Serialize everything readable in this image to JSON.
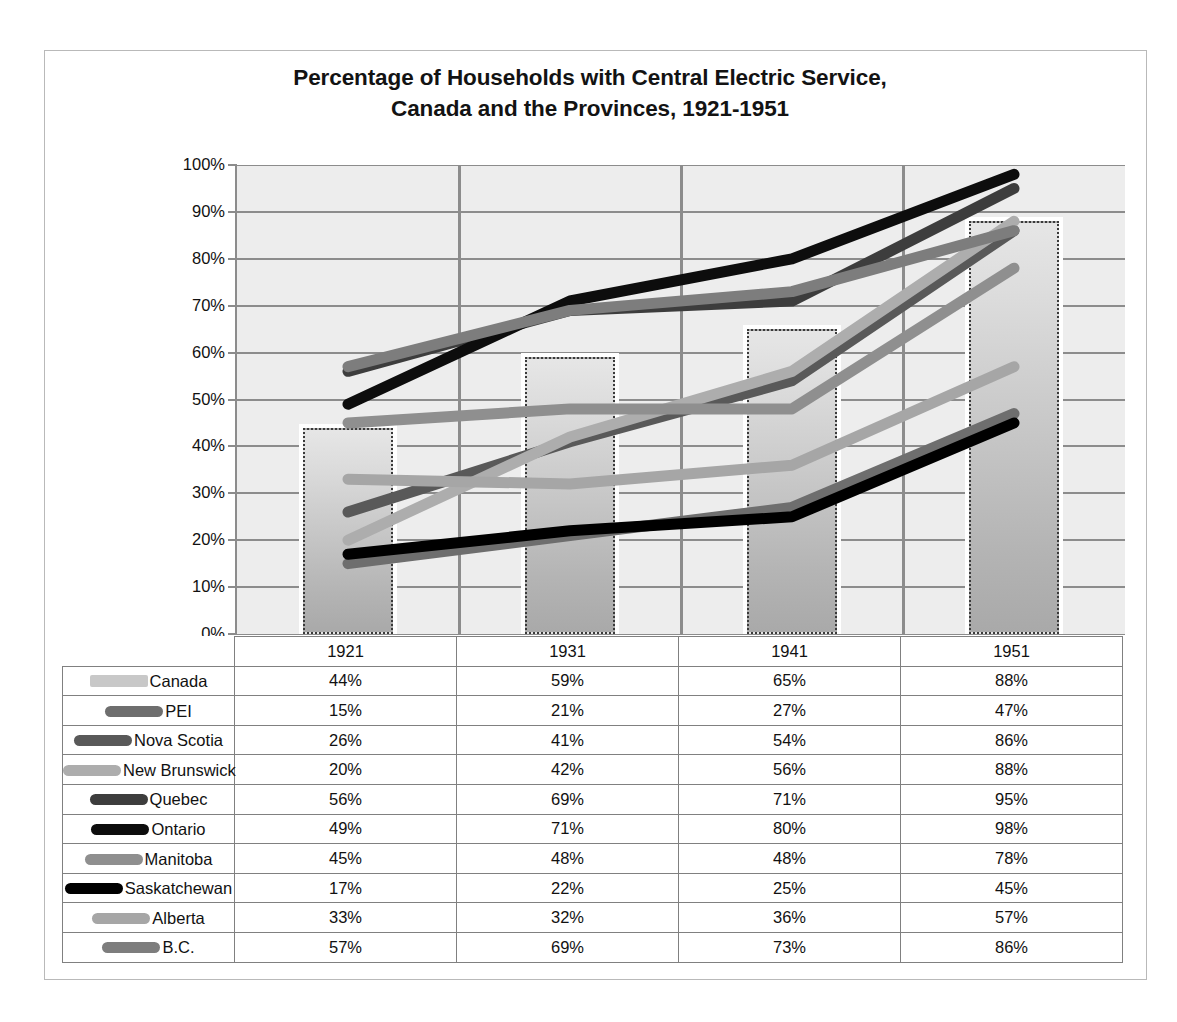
{
  "chart_data": {
    "type": "line",
    "title_line1": "Percentage of Households  with Central Electric Service,",
    "title_line2": "Canada  and the Provinces, 1921-1951",
    "title": "Percentage of Households with Central Electric Service, Canada and the Provinces, 1921-1951",
    "xlabel": "",
    "ylabel": "",
    "categories": [
      "1921",
      "1931",
      "1941",
      "1951"
    ],
    "ylim": [
      0,
      100
    ],
    "ytick_labels": [
      "0%",
      "10%",
      "20%",
      "30%",
      "40%",
      "50%",
      "60%",
      "70%",
      "80%",
      "90%",
      "100%"
    ],
    "ytick_values": [
      0,
      10,
      20,
      30,
      40,
      50,
      60,
      70,
      80,
      90,
      100
    ],
    "grid": true,
    "legend_position": "table-below",
    "series": [
      {
        "name": "Canada",
        "type": "bar",
        "values": [
          44,
          59,
          65,
          88
        ],
        "labels": [
          "44%",
          "59%",
          "65%",
          "88%"
        ],
        "color": "#c8c8c8"
      },
      {
        "name": "PEI",
        "type": "line",
        "values": [
          15,
          21,
          27,
          47
        ],
        "labels": [
          "15%",
          "21%",
          "27%",
          "47%"
        ],
        "color": "#6e6e6e"
      },
      {
        "name": "Nova Scotia",
        "type": "line",
        "values": [
          26,
          41,
          54,
          86
        ],
        "labels": [
          "26%",
          "41%",
          "54%",
          "86%"
        ],
        "color": "#595959"
      },
      {
        "name": "New Brunswick",
        "type": "line",
        "values": [
          20,
          42,
          56,
          88
        ],
        "labels": [
          "20%",
          "42%",
          "56%",
          "88%"
        ],
        "color": "#adadad"
      },
      {
        "name": "Quebec",
        "type": "line",
        "values": [
          56,
          69,
          71,
          95
        ],
        "labels": [
          "56%",
          "69%",
          "71%",
          "95%"
        ],
        "color": "#3d3d3d"
      },
      {
        "name": "Ontario",
        "type": "line",
        "values": [
          49,
          71,
          80,
          98
        ],
        "labels": [
          "49%",
          "71%",
          "80%",
          "98%"
        ],
        "color": "#0d0d0d"
      },
      {
        "name": "Manitoba",
        "type": "line",
        "values": [
          45,
          48,
          48,
          78
        ],
        "labels": [
          "45%",
          "48%",
          "48%",
          "78%"
        ],
        "color": "#8f8f8f"
      },
      {
        "name": "Saskatchewan",
        "type": "line",
        "values": [
          17,
          22,
          25,
          45
        ],
        "labels": [
          "17%",
          "22%",
          "25%",
          "45%"
        ],
        "color": "#000000"
      },
      {
        "name": "Alberta",
        "type": "line",
        "values": [
          33,
          32,
          36,
          57
        ],
        "labels": [
          "33%",
          "32%",
          "36%",
          "57%"
        ],
        "color": "#a6a6a6"
      },
      {
        "name": "B.C.",
        "type": "line",
        "values": [
          57,
          69,
          73,
          86
        ],
        "labels": [
          "57%",
          "69%",
          "73%",
          "86%"
        ],
        "color": "#7d7d7d"
      }
    ]
  },
  "table": {
    "header_blank": "",
    "columns": [
      "1921",
      "1931",
      "1941",
      "1951"
    ],
    "rows": [
      {
        "name": "Canada",
        "values": [
          "44%",
          "59%",
          "65%",
          "88%"
        ]
      },
      {
        "name": "PEI",
        "values": [
          "15%",
          "21%",
          "27%",
          "47%"
        ]
      },
      {
        "name": "Nova Scotia",
        "values": [
          "26%",
          "41%",
          "54%",
          "86%"
        ]
      },
      {
        "name": "New Brunswick",
        "values": [
          "20%",
          "42%",
          "56%",
          "88%"
        ]
      },
      {
        "name": "Quebec",
        "values": [
          "56%",
          "69%",
          "71%",
          "95%"
        ]
      },
      {
        "name": "Ontario",
        "values": [
          "49%",
          "71%",
          "80%",
          "98%"
        ]
      },
      {
        "name": "Manitoba",
        "values": [
          "45%",
          "48%",
          "48%",
          "78%"
        ]
      },
      {
        "name": "Saskatchewan",
        "values": [
          "17%",
          "22%",
          "25%",
          "45%"
        ]
      },
      {
        "name": "Alberta",
        "values": [
          "33%",
          "32%",
          "36%",
          "57%"
        ]
      },
      {
        "name": "B.C.",
        "values": [
          "57%",
          "69%",
          "73%",
          "86%"
        ]
      }
    ]
  },
  "style": {
    "plot_background": "#ededed",
    "gridline_color": "#8c8c8c",
    "axis_color": "#8c8c8c",
    "frame_border": "#b9b9b9",
    "table_border": "#808080",
    "text_color": "#111111"
  }
}
